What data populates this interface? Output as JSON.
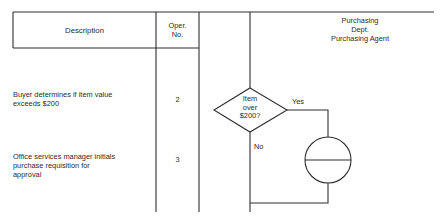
{
  "header": {
    "description_label": "Description",
    "oper_no_label_line1": "Oper.",
    "oper_no_label_line2": "No.",
    "lane_title_line1": "Purchasing",
    "lane_title_line2": "Dept.",
    "lane_title_line3": "Purchasing Agent"
  },
  "rows": [
    {
      "description_line1": "Buyer determines if item value",
      "description_line2": "exceeds $200",
      "oper_no": "2"
    },
    {
      "description_line1": "Office services manager initials",
      "description_line2": "purchase requisition for",
      "description_line3": "approval",
      "oper_no": "3"
    }
  ],
  "flow": {
    "decision_line1": "Item",
    "decision_line2": "over",
    "decision_line3": "$200?",
    "yes_label": "Yes",
    "no_label": "No",
    "yes_step_shape": "circle-with-horizontal-bar",
    "line_color": "#2f2f2f"
  }
}
